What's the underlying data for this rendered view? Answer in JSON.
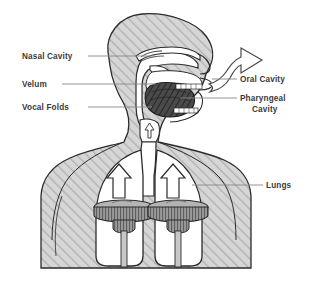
{
  "figure": {
    "background_color": "#ffffff",
    "outline_color": "#2b2b2b",
    "body_fill_color": "#d6d6d6",
    "hatch_line_color": "#b0b0b0",
    "cavity_fill_color": "#ffffff",
    "tongue_fill_color": "#4a4a4a",
    "piston_fill_color": "#9a9a9a",
    "leader_line_color": "#888888",
    "label_text_color": "#3a3a3a"
  },
  "labels": {
    "nasal_cavity": "Nasal Cavity",
    "velum": "Velum",
    "vocal_folds": "Vocal Folds",
    "oral_cavity": "Oral Cavity",
    "pharyngeal_cavity_line1": "Pharyngeal",
    "pharyngeal_cavity_line2": "Cavity",
    "lungs": "Lungs"
  },
  "label_list": [
    {
      "name": "nasal-cavity",
      "text": "Nasal Cavity",
      "side": "left",
      "x": 22,
      "y": 59
    },
    {
      "name": "velum",
      "text": "Velum",
      "side": "left",
      "x": 22,
      "y": 87
    },
    {
      "name": "vocal-folds",
      "text": "Vocal Folds",
      "side": "left",
      "x": 22,
      "y": 110
    },
    {
      "name": "oral-cavity",
      "text": "Oral Cavity",
      "side": "right",
      "x": 240,
      "y": 81
    },
    {
      "name": "pharyngeal-cavity",
      "text": "Pharyngeal Cavity",
      "side": "right",
      "x": 240,
      "y": 101
    },
    {
      "name": "lungs",
      "text": "Lungs",
      "side": "right",
      "x": 266,
      "y": 188
    }
  ],
  "anatomy_parts": [
    "head-silhouette",
    "nasal-cavity-passage",
    "velum-flap",
    "tongue",
    "teeth",
    "pharyngeal-cavity",
    "larynx-vocal-folds",
    "trachea",
    "left-lung",
    "right-lung",
    "left-diaphragm-piston",
    "right-diaphragm-piston",
    "airflow-arrow"
  ],
  "arrows": {
    "lung_left": "upward-arrow",
    "lung_right": "upward-arrow",
    "larynx": "upward-arrow",
    "mouth_outflow": "curved-outflow-arrow"
  }
}
